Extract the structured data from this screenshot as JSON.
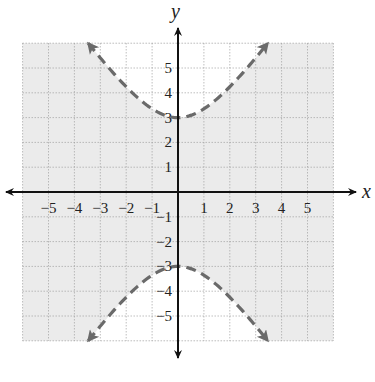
{
  "chart_data": {
    "type": "line",
    "title": "",
    "xlabel": "x",
    "ylabel": "y",
    "xlim": [
      -6,
      6
    ],
    "ylim": [
      -6,
      6
    ],
    "grid": true,
    "x_ticks": [
      -5,
      -4,
      -3,
      -2,
      -1,
      1,
      2,
      3,
      4,
      5
    ],
    "y_ticks": [
      -5,
      -4,
      -3,
      -2,
      -1,
      1,
      2,
      3,
      4,
      5
    ],
    "x_tick_labels": [
      "−5",
      "−4",
      "−3",
      "−2",
      "−1",
      "1",
      "2",
      "3",
      "4",
      "5"
    ],
    "y_tick_labels": [
      "−5",
      "−4",
      "−3",
      "−2",
      "−1",
      "1",
      "2",
      "3",
      "4",
      "5"
    ],
    "series": [
      {
        "name": "hyperbola boundary y²/9 − x²/4 = 1",
        "style": "dashed",
        "branches": [
          {
            "name": "upper",
            "x": [
              -3.46,
              -2,
              -1,
              0,
              1,
              2,
              3.46
            ],
            "y": [
              6,
              4.24,
              3.35,
              3,
              3.35,
              4.24,
              6
            ]
          },
          {
            "name": "lower",
            "x": [
              -3.46,
              -2,
              -1,
              0,
              1,
              2,
              3.46
            ],
            "y": [
              -6,
              -4.24,
              -3.35,
              -3,
              -3.35,
              -4.24,
              -6
            ]
          }
        ]
      }
    ],
    "shaded_region": "outside the branches (between upper and lower branch): y²/9 − x²/4 < 1",
    "vertices": [
      [
        0,
        3
      ],
      [
        0,
        -3
      ]
    ]
  },
  "labels": {
    "x_axis": "x",
    "y_axis": "y"
  },
  "colors": {
    "shade": "#ebebeb",
    "grid": "#9a9a9a",
    "axis": "#111111",
    "curve": "#6a6a6a"
  }
}
